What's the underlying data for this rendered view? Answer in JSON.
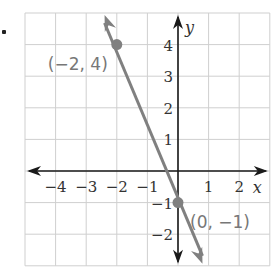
{
  "chart_data": {
    "type": "line",
    "title": "",
    "xlabel": "x",
    "ylabel": "y",
    "xlim": [
      -5,
      3
    ],
    "ylim": [
      -3,
      5
    ],
    "grid": true,
    "x_ticks": [
      -4,
      -3,
      -2,
      -1,
      1,
      2
    ],
    "x_tick_labels": [
      "−4",
      "−3",
      "−2",
      "−1",
      "1",
      "2"
    ],
    "y_ticks": [
      4,
      3,
      2,
      1,
      -1,
      -2
    ],
    "y_tick_labels": [
      "4",
      "3",
      "2",
      "1",
      "−1",
      "−2"
    ],
    "series": [
      {
        "name": "line",
        "equation": "y = -2.5x - 1",
        "x": [
          -2,
          0
        ],
        "y": [
          4,
          -1
        ],
        "color": "#808080"
      }
    ],
    "points": [
      {
        "x": -2,
        "y": 4,
        "label": "(−2, 4)"
      },
      {
        "x": 0,
        "y": -1,
        "label": "(0, −1)"
      }
    ],
    "annotations": [
      "(−2, 4)",
      "(0, −1)"
    ]
  },
  "colors": {
    "grid": "#cfcfcf",
    "axis": "#1a1a1a",
    "line": "#808080",
    "point": "#808080",
    "label": "#777777"
  }
}
